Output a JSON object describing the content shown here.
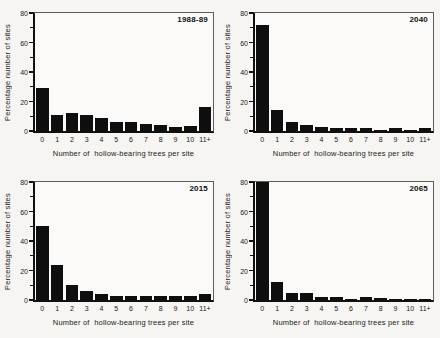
{
  "figure": {
    "y_ticks": [
      0,
      20,
      40,
      60,
      80
    ],
    "y_minor_ticks": [
      10,
      30,
      50,
      70
    ],
    "bar_color": "#0e0e0e",
    "background": "#f6f5f2"
  },
  "chart_data": [
    {
      "type": "bar",
      "title": "1988-89",
      "categories": [
        "0",
        "1",
        "2",
        "3",
        "4",
        "5",
        "6",
        "7",
        "8",
        "9",
        "10",
        "11+"
      ],
      "values": [
        29,
        11,
        12,
        11,
        9,
        6,
        6,
        5,
        4,
        3,
        3.5,
        16
      ],
      "xlabel": "Number of  hollow-bearing trees per site",
      "ylabel": "Percentage number of sites",
      "ylim": [
        0,
        80
      ],
      "y_ticks": [
        0,
        20,
        40,
        60,
        80
      ],
      "legend": "none",
      "grid": false
    },
    {
      "type": "bar",
      "title": "2040",
      "categories": [
        "0",
        "1",
        "2",
        "3",
        "4",
        "5",
        "6",
        "7",
        "8",
        "9",
        "10",
        "11+"
      ],
      "values": [
        72,
        14,
        6,
        4,
        3,
        2,
        2,
        2,
        1,
        2,
        1,
        2
      ],
      "xlabel": "Number of  hollow-bearing trees per site",
      "ylabel": "Percentage number of sites",
      "ylim": [
        0,
        80
      ],
      "y_ticks": [
        0,
        20,
        40,
        60,
        80
      ],
      "legend": "none",
      "grid": false
    },
    {
      "type": "bar",
      "title": "2015",
      "categories": [
        "0",
        "1",
        "2",
        "3",
        "4",
        "5",
        "6",
        "7",
        "8",
        "9",
        "10",
        "11+"
      ],
      "values": [
        50,
        24,
        10,
        6,
        4,
        3,
        3,
        3,
        2.5,
        3,
        2.5,
        4
      ],
      "xlabel": "Number of  hollow-bearing trees per site",
      "ylabel": "Percentage number of sites",
      "ylim": [
        0,
        80
      ],
      "y_ticks": [
        0,
        20,
        40,
        60,
        80
      ],
      "legend": "none",
      "grid": false
    },
    {
      "type": "bar",
      "title": "2065",
      "categories": [
        "0",
        "1",
        "2",
        "3",
        "4",
        "5",
        "6",
        "7",
        "8",
        "9",
        "10",
        "11+"
      ],
      "values": [
        80,
        12,
        5,
        4.5,
        2,
        2,
        1,
        2,
        1.5,
        1,
        1,
        1
      ],
      "xlabel": "Number of  hollow-bearing trees per site",
      "ylabel": "Percentage number of sites",
      "ylim": [
        0,
        80
      ],
      "y_ticks": [
        0,
        20,
        40,
        60,
        80
      ],
      "legend": "none",
      "grid": false
    }
  ]
}
